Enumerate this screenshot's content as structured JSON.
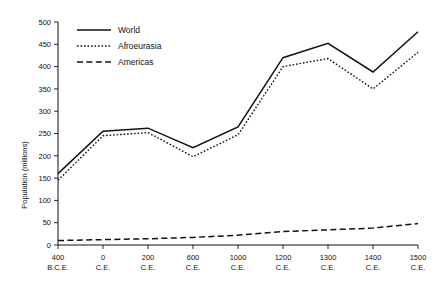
{
  "chart_data": {
    "type": "line",
    "title": "",
    "xlabel": "",
    "ylabel": "Population (millions)",
    "ylim": [
      0,
      500
    ],
    "yticks": [
      0,
      50,
      100,
      150,
      200,
      250,
      300,
      350,
      400,
      450,
      500
    ],
    "ytick_labels": [
      "0",
      "50",
      "100",
      "150",
      "200",
      "250",
      "300",
      "350",
      "400",
      "450",
      "500"
    ],
    "grid": false,
    "legend_position": "top-left",
    "categories": [
      "400 B.C.E.",
      "0 C.E.",
      "200 C.E.",
      "600 C.E.",
      "1000 C.E.",
      "1200 C.E.",
      "1300 C.E.",
      "1400 C.E.",
      "1500 C.E."
    ],
    "xtick_labels": [
      {
        "line1": "400",
        "line2": "B.C.E."
      },
      {
        "line1": "0",
        "line2": "C.E."
      },
      {
        "line1": "200",
        "line2": "C.E."
      },
      {
        "line1": "600",
        "line2": "C.E."
      },
      {
        "line1": "1000",
        "line2": "C.E."
      },
      {
        "line1": "1200",
        "line2": "C.E."
      },
      {
        "line1": "1300",
        "line2": "C.E."
      },
      {
        "line1": "1400",
        "line2": "C.E."
      },
      {
        "line1": "1500",
        "line2": "C.E."
      }
    ],
    "series": [
      {
        "name": "World",
        "style": "solid",
        "values": [
          160,
          255,
          262,
          218,
          265,
          420,
          452,
          388,
          478
        ]
      },
      {
        "name": "Afroeurasia",
        "style": "dotted",
        "values": [
          145,
          245,
          252,
          198,
          247,
          400,
          418,
          350,
          432
        ]
      },
      {
        "name": "Americas",
        "style": "dashed",
        "values": [
          10,
          12,
          14,
          17,
          22,
          30,
          34,
          38,
          48
        ]
      }
    ]
  },
  "legend": {
    "items": [
      {
        "label": "World",
        "style": "solid"
      },
      {
        "label": "Afroeurasia",
        "style": "dotted"
      },
      {
        "label": "Americas",
        "style": "dashed"
      }
    ]
  }
}
